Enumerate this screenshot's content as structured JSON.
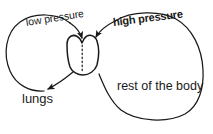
{
  "diagram": {
    "background_color": "#ffffff",
    "stroke_color": "#1a1a1a",
    "labels": {
      "low_pressure": "low pressure",
      "high_pressure": "high pressure",
      "lungs": "lungs",
      "rest_of_the_body": "rest of the body"
    },
    "parts": {
      "heart": "heart",
      "septum": "dotted septum line",
      "pulmonary_loop": "left loop to lungs",
      "systemic_loop": "right loop to rest of the body"
    },
    "arrows": {
      "into_heart_left": "arrow from lungs loop into heart",
      "into_heart_right": "arrow from body loop into heart",
      "out_to_lungs": "arrow from heart out to lungs"
    }
  }
}
